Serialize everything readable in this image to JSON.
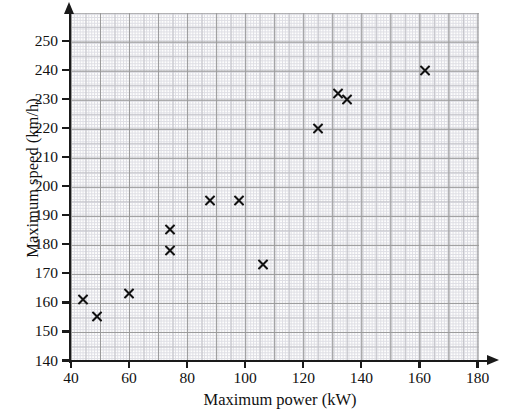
{
  "chart_data": {
    "type": "scatter",
    "title": "",
    "xlabel": "Maximum power (kW)",
    "ylabel": "Maximum speed (km/h)",
    "xlim": [
      40,
      180
    ],
    "ylim": [
      140,
      250
    ],
    "x_ticks": [
      40,
      60,
      80,
      100,
      120,
      140,
      160,
      180
    ],
    "y_ticks": [
      140,
      150,
      160,
      170,
      180,
      190,
      200,
      210,
      220,
      230,
      240,
      250
    ],
    "grid": true,
    "legend": null,
    "marker": "x",
    "marker_color": "#111111",
    "points": [
      {
        "x": 44,
        "y": 161
      },
      {
        "x": 49,
        "y": 155
      },
      {
        "x": 60,
        "y": 163
      },
      {
        "x": 74,
        "y": 185
      },
      {
        "x": 74,
        "y": 178
      },
      {
        "x": 88,
        "y": 195
      },
      {
        "x": 98,
        "y": 195
      },
      {
        "x": 106,
        "y": 173
      },
      {
        "x": 125,
        "y": 220
      },
      {
        "x": 132,
        "y": 232
      },
      {
        "x": 135,
        "y": 230
      },
      {
        "x": 162,
        "y": 240
      }
    ]
  },
  "axes": {
    "x_tick_labels": [
      "40",
      "60",
      "80",
      "100",
      "120",
      "140",
      "160",
      "180"
    ],
    "y_tick_labels": [
      "140",
      "150",
      "160",
      "170",
      "180",
      "190",
      "200",
      "210",
      "220",
      "230",
      "240",
      "250"
    ],
    "x_title": "Maximum power (kW)",
    "y_title": "Maximum speed (km/h)"
  }
}
